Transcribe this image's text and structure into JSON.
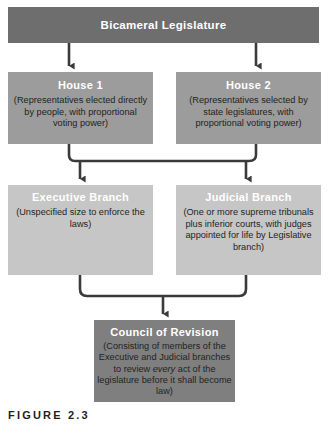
{
  "figure": {
    "caption": "FIGURE 2.3"
  },
  "colors": {
    "legislature_box": "#6e6e6e",
    "house_box": "#9c9c9c",
    "branch_box": "#c6c6c6",
    "council_box": "#7f7f7f",
    "connector": "#3a3a3a",
    "title_text": "#ffffff",
    "body_text": "#231f20",
    "page_background": "#ffffff"
  },
  "diagram": {
    "type": "flowchart",
    "levels": [
      {
        "level": 1,
        "nodes": [
          {
            "id": "bicameral-legislature",
            "title": "Bicameral Legislature",
            "body": ""
          }
        ]
      },
      {
        "level": 2,
        "nodes": [
          {
            "id": "house-1",
            "title": "House 1",
            "body": "(Representatives elected directly by people, with proportional voting power)"
          },
          {
            "id": "house-2",
            "title": "House 2",
            "body": "(Representatives selected by state legislatures, with proportional voting power)"
          }
        ]
      },
      {
        "level": 3,
        "nodes": [
          {
            "id": "executive-branch",
            "title": "Executive Branch",
            "body": "(Unspecified size to enforce the laws)"
          },
          {
            "id": "judicial-branch",
            "title": "Judicial Branch",
            "body": "(One or more supreme tribunals plus inferior courts, with judges appointed for life by Legislative branch)"
          }
        ]
      },
      {
        "level": 4,
        "nodes": [
          {
            "id": "council-of-revision",
            "title": "Council of Revision",
            "body_part_1": "(Consisting of members of the Executive and Judicial branches to review",
            "body_emphasis": "every",
            "body_part_2": "act of the legislature before it shall become law)"
          }
        ]
      }
    ],
    "connections": [
      {
        "from": "bicameral-legislature",
        "to": "house-1",
        "style": "arrow-down"
      },
      {
        "from": "bicameral-legislature",
        "to": "house-2",
        "style": "arrow-down"
      },
      {
        "from": "house-1,house-2",
        "to": "executive-branch",
        "style": "bracket-arrow-down"
      },
      {
        "from": "house-1,house-2",
        "to": "judicial-branch",
        "style": "bracket-arrow-down"
      },
      {
        "from": "executive-branch,judicial-branch",
        "to": "council-of-revision",
        "style": "bracket-merge-arrow-down"
      }
    ]
  }
}
